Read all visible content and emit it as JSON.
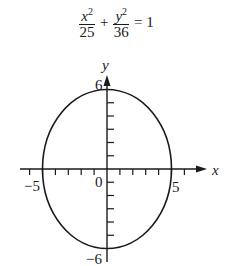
{
  "equation": {
    "term1_num": "x",
    "term1_exp": "2",
    "term1_den": "25",
    "plus": "+",
    "term2_num": "y",
    "term2_exp": "2",
    "term2_den": "36",
    "equals": "= 1"
  },
  "axes": {
    "x_label": "x",
    "y_label": "y",
    "origin_label": "0",
    "x_neg_label": "−5",
    "x_pos_label": "5",
    "y_pos_label": "6",
    "y_neg_label": "−6"
  },
  "ellipse": {
    "semi_major_axis_y": 6,
    "semi_minor_axis_x": 5,
    "center": [
      0,
      0
    ]
  },
  "colors": {
    "stroke": "#1a1a1a",
    "background": "#ffffff"
  }
}
